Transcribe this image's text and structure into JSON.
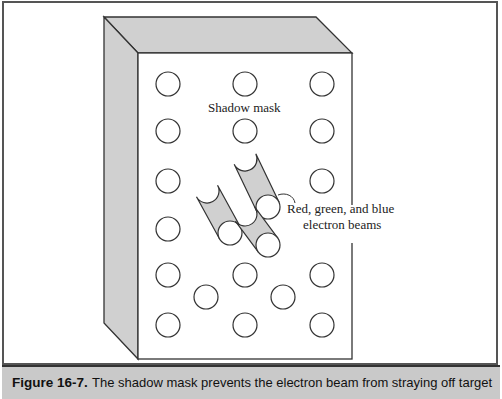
{
  "figure": {
    "number_label": "Figure 16-7.",
    "caption": "The shadow mask prevents the electron beam from straying off target",
    "labels": {
      "shadow_mask": "Shadow mask",
      "beams_line1": "Red, green, and blue",
      "beams_line2": "electron beams"
    },
    "colors": {
      "shade": "#d0d0d0",
      "outline": "#333333",
      "caption_bg": "#c9c9c9"
    },
    "holes": [
      [
        168,
        84
      ],
      [
        245,
        84
      ],
      [
        322,
        84
      ],
      [
        168,
        131
      ],
      [
        245,
        131
      ],
      [
        322,
        131
      ],
      [
        168,
        181
      ],
      [
        322,
        181
      ],
      [
        168,
        229
      ],
      [
        168,
        275
      ],
      [
        245,
        275
      ],
      [
        322,
        275
      ],
      [
        206,
        297
      ],
      [
        283,
        297
      ],
      [
        168,
        325
      ],
      [
        245,
        325
      ],
      [
        322,
        325
      ]
    ],
    "beams": [
      {
        "from": [
          245,
          159
        ],
        "to": [
          268,
          207
        ]
      },
      {
        "from": [
          207,
          191
        ],
        "to": [
          230,
          233
        ]
      },
      {
        "from": [
          245,
          214
        ],
        "to": [
          268,
          245
        ]
      }
    ]
  }
}
